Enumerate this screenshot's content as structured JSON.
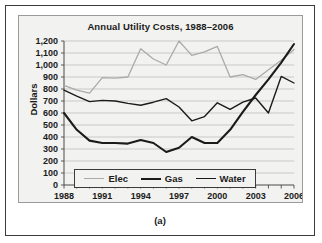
{
  "figure": {
    "caption": "(a)"
  },
  "legend": {
    "position": "inside-bottom-center",
    "items": [
      {
        "label": "Elec",
        "color": "#aaaaaa",
        "width": 1.3
      },
      {
        "label": "Gas",
        "color": "#1b1b1b",
        "width": 2.1
      },
      {
        "label": "Water",
        "color": "#1b1b1b",
        "width": 1.4
      }
    ]
  },
  "chart_data": {
    "type": "line",
    "title": "Annual Utility Costs, 1988–2006",
    "xlabel": "",
    "ylabel": "Dollars",
    "ylim": [
      0,
      1200
    ],
    "ytick_step": 100,
    "ytick_labels": [
      "1,200",
      "1,100",
      "1,000",
      "900",
      "800",
      "700",
      "600",
      "500",
      "400",
      "300",
      "200",
      "100",
      "0"
    ],
    "ytick_values": [
      1200,
      1100,
      1000,
      900,
      800,
      700,
      600,
      500,
      400,
      300,
      200,
      100,
      0
    ],
    "grid": true,
    "x": [
      1988,
      1989,
      1990,
      1991,
      1992,
      1993,
      1994,
      1995,
      1996,
      1997,
      1998,
      1999,
      2000,
      2001,
      2002,
      2003,
      2004,
      2005,
      2006
    ],
    "xlim": [
      1988,
      2006
    ],
    "xtick_labels": [
      "1988",
      "1991",
      "1994",
      "1997",
      "2000",
      "2003",
      "2006"
    ],
    "xtick_values": [
      1988,
      1991,
      1994,
      1997,
      2000,
      2003,
      2006
    ],
    "series": [
      {
        "name": "Elec",
        "color": "#aaaaaa",
        "width": 1.3,
        "values": [
          830,
          790,
          765,
          895,
          890,
          900,
          1135,
          1050,
          1000,
          1200,
          1080,
          1110,
          1155,
          900,
          920,
          880,
          960,
          1040,
          1130
        ]
      },
      {
        "name": "Gas",
        "color": "#1b1b1b",
        "width": 2.1,
        "values": [
          600,
          460,
          370,
          350,
          350,
          345,
          375,
          350,
          275,
          310,
          400,
          350,
          350,
          460,
          610,
          750,
          880,
          1020,
          1175
        ]
      },
      {
        "name": "Water",
        "color": "#1b1b1b",
        "width": 1.4,
        "values": [
          790,
          740,
          695,
          705,
          700,
          680,
          665,
          690,
          720,
          650,
          535,
          570,
          685,
          630,
          690,
          725,
          600,
          905,
          850
        ]
      }
    ]
  }
}
